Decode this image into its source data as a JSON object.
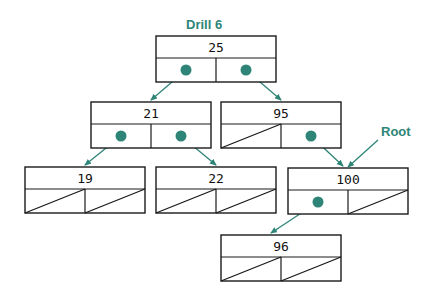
{
  "title_label": "Drill 6",
  "root_label": "Root",
  "colors": {
    "accent": "#2e8577",
    "line": "#1a1a1a",
    "background": "#ffffff"
  },
  "nodes": [
    {
      "id": "n25",
      "value": "25",
      "x": 156,
      "y": 36,
      "left": "pointer",
      "right": "pointer"
    },
    {
      "id": "n21",
      "value": "21",
      "x": 91,
      "y": 102,
      "left": "pointer",
      "right": "pointer"
    },
    {
      "id": "n95",
      "value": "95",
      "x": 221,
      "y": 102,
      "left": "null",
      "right": "pointer"
    },
    {
      "id": "n19",
      "value": "19",
      "x": 25,
      "y": 167,
      "left": "null",
      "right": "null"
    },
    {
      "id": "n22",
      "value": "22",
      "x": 156,
      "y": 167,
      "left": "null",
      "right": "null"
    },
    {
      "id": "n100",
      "value": "100",
      "x": 288,
      "y": 168,
      "left": "pointer",
      "right": "null"
    },
    {
      "id": "n96",
      "value": "96",
      "x": 221,
      "y": 235,
      "left": "null",
      "right": "null"
    }
  ],
  "edges": [
    {
      "from": "n25",
      "side": "left",
      "to": "n21"
    },
    {
      "from": "n25",
      "side": "right",
      "to": "n95"
    },
    {
      "from": "n21",
      "side": "left",
      "to": "n19"
    },
    {
      "from": "n21",
      "side": "right",
      "to": "n22"
    },
    {
      "from": "n95",
      "side": "right",
      "to": "n100"
    },
    {
      "from": "n100",
      "side": "left",
      "to": "n96"
    }
  ]
}
